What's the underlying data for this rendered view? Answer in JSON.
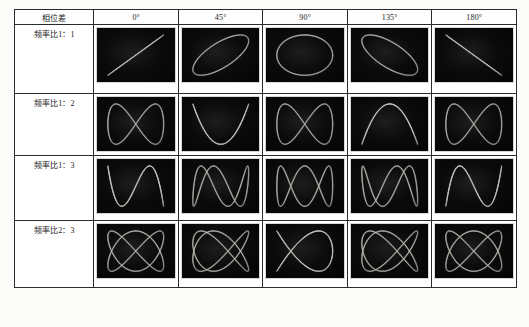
{
  "table": {
    "corner_header": "相位差",
    "column_headers": [
      "0°",
      "45°",
      "90°",
      "135°",
      "180°"
    ],
    "row_headers": [
      "频率比1：1",
      "频率比1：2",
      "频率比1：3",
      "频率比2：3"
    ],
    "phases_deg": [
      0,
      45,
      90,
      135,
      180
    ],
    "ratios": [
      {
        "label": "频率比1：1",
        "fx": 1,
        "fy": 1
      },
      {
        "label": "频率比1：2",
        "fx": 1,
        "fy": 2
      },
      {
        "label": "频率比1：3",
        "fx": 1,
        "fy": 3
      },
      {
        "label": "频率比2：3",
        "fx": 2,
        "fy": 3
      }
    ],
    "cell_descriptions": [
      [
        "diagonal-line",
        "tilted-ellipse-ccw",
        "circle",
        "tilted-ellipse-cw",
        "anti-diagonal-line"
      ],
      [
        "figure-eight",
        "double-arch",
        "double-arch",
        "figure-eight",
        "figure-eight"
      ],
      [
        "triple-lobe-open",
        "triple-lobe",
        "triple-lobe",
        "triple-lobe",
        "triple-lobe-closed"
      ],
      [
        "two-by-three",
        "two-by-three-open",
        "two-by-three",
        "two-by-three-narrow",
        "two-by-three"
      ]
    ]
  },
  "colors": {
    "trace": "#f0efe4",
    "screen": "#0a0a0a",
    "border": "#2b2b2b",
    "page": "#fcfcfa",
    "text": "#1a1a1a"
  },
  "chart_data": {
    "type": "line",
    "xlabel": "相位差",
    "ylabel": "频率比",
    "categories": [
      "0°",
      "45°",
      "90°",
      "135°",
      "180°"
    ],
    "series": [
      {
        "name": "频率比1：1",
        "fx": 1,
        "fy": 1,
        "values": [
          0,
          45,
          90,
          135,
          180
        ]
      },
      {
        "name": "频率比1：2",
        "fx": 1,
        "fy": 2,
        "values": [
          0,
          45,
          90,
          135,
          180
        ]
      },
      {
        "name": "频率比1：3",
        "fx": 1,
        "fy": 3,
        "values": [
          0,
          45,
          90,
          135,
          180
        ]
      },
      {
        "name": "频率比2：3",
        "fx": 2,
        "fy": 3,
        "values": [
          0,
          45,
          90,
          135,
          180
        ]
      }
    ],
    "grid": true,
    "legend": "none",
    "equations": {
      "x": "A·sin(fx·t + φ)",
      "y": "B·sin(fy·t)"
    }
  }
}
